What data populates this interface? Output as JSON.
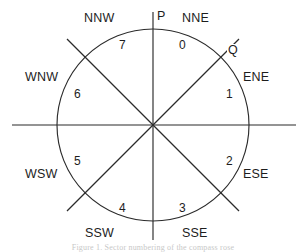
{
  "figure": {
    "type": "compass-sector-diagram",
    "background_color": "#ffffff",
    "stroke_color": "#2b2b2b",
    "text_color": "#1d1d1d",
    "caption": "Figure 1. Sector numbering of the compass rose"
  },
  "geometry": {
    "center_x": 153,
    "center_y": 125,
    "radius": 96,
    "axis_h_start_x": 12,
    "axis_h_end_x": 296,
    "axis_v_start_y": 12,
    "axis_v_end_y": 240,
    "diagonal_half_length": 122
  },
  "direction_labels": [
    {
      "text": "NNW",
      "x": 83,
      "y": 12
    },
    {
      "text": "NNE",
      "x": 181,
      "y": 12
    },
    {
      "text": "ENE",
      "x": 242,
      "y": 71
    },
    {
      "text": "ESE",
      "x": 242,
      "y": 168
    },
    {
      "text": "SSE",
      "x": 181,
      "y": 227
    },
    {
      "text": "SSW",
      "x": 84,
      "y": 227
    },
    {
      "text": "WSW",
      "x": 24,
      "y": 168
    },
    {
      "text": "WNW",
      "x": 24,
      "y": 71
    }
  ],
  "sector_labels": [
    {
      "text": "0",
      "x": 178,
      "y": 39
    },
    {
      "text": "1",
      "x": 225,
      "y": 88
    },
    {
      "text": "2",
      "x": 225,
      "y": 155
    },
    {
      "text": "3",
      "x": 178,
      "y": 202
    },
    {
      "text": "4",
      "x": 118,
      "y": 202
    },
    {
      "text": "5",
      "x": 73,
      "y": 155
    },
    {
      "text": "6",
      "x": 73,
      "y": 88
    },
    {
      "text": "7",
      "x": 118,
      "y": 39
    }
  ],
  "point_labels": [
    {
      "text": "P",
      "x": 156,
      "y": 10
    },
    {
      "text": "Q",
      "x": 227,
      "y": 44
    }
  ]
}
